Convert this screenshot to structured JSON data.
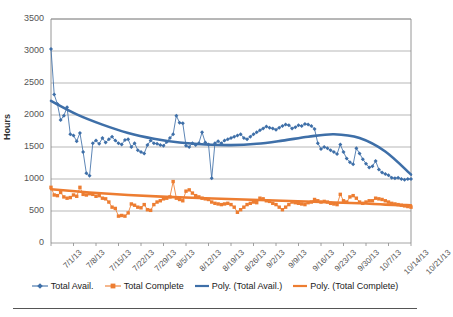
{
  "chart_data": {
    "type": "line",
    "title": "",
    "xlabel": "",
    "ylabel": "Hours",
    "ylim": [
      0,
      3500
    ],
    "ytick_values": [
      0,
      500,
      1000,
      1500,
      2000,
      2500,
      3000,
      3500
    ],
    "ytick_labels": [
      "0",
      "500",
      "1000",
      "1500",
      "2000",
      "2500",
      "3000",
      "3500"
    ],
    "grid": true,
    "legend_position": "bottom",
    "x_tick_labels": [
      "7/1/13",
      "7/8/13",
      "7/15/13",
      "7/22/13",
      "7/29/13",
      "8/5/13",
      "8/12/13",
      "8/19/13",
      "8/26/13",
      "9/2/13",
      "9/9/13",
      "9/16/13",
      "9/23/13",
      "9/30/13",
      "10/7/13",
      "10/14/13",
      "10/21/13"
    ],
    "x_tick_indices": [
      0,
      7,
      14,
      21,
      28,
      35,
      42,
      49,
      56,
      63,
      70,
      77,
      84,
      91,
      98,
      105,
      112
    ],
    "x_count": 113,
    "series": [
      {
        "name": "Total Avail.",
        "color": "#3E6FA8",
        "marker": "diamond",
        "values": [
          3030,
          2320,
          2170,
          1920,
          1990,
          2120,
          1700,
          1680,
          1590,
          1720,
          1420,
          1090,
          1050,
          1560,
          1600,
          1550,
          1640,
          1570,
          1620,
          1660,
          1600,
          1560,
          1540,
          1610,
          1620,
          1500,
          1560,
          1450,
          1420,
          1400,
          1530,
          1600,
          1560,
          1550,
          1530,
          1520,
          1580,
          1640,
          1700,
          1990,
          1880,
          1870,
          1520,
          1500,
          1560,
          1530,
          1560,
          1730,
          1570,
          1540,
          1010,
          1560,
          1590,
          1560,
          1600,
          1620,
          1640,
          1660,
          1680,
          1700,
          1640,
          1620,
          1660,
          1700,
          1730,
          1760,
          1790,
          1820,
          1800,
          1790,
          1770,
          1800,
          1830,
          1850,
          1840,
          1790,
          1810,
          1840,
          1830,
          1860,
          1850,
          1830,
          1780,
          1560,
          1470,
          1500,
          1480,
          1450,
          1420,
          1390,
          1540,
          1420,
          1320,
          1260,
          1230,
          1480,
          1400,
          1310,
          1240,
          1180,
          1200,
          1280,
          1150,
          1100,
          1080,
          1060,
          1020,
          1010,
          1020,
          1000,
          990,
          1000,
          1000
        ]
      },
      {
        "name": "Total Complete",
        "color": "#ED7D31",
        "marker": "square",
        "values": [
          870,
          750,
          740,
          790,
          720,
          700,
          710,
          750,
          730,
          870,
          760,
          750,
          770,
          760,
          730,
          740,
          700,
          690,
          640,
          560,
          540,
          420,
          430,
          420,
          470,
          610,
          590,
          560,
          550,
          600,
          520,
          510,
          600,
          640,
          660,
          690,
          700,
          720,
          960,
          700,
          680,
          660,
          810,
          830,
          780,
          740,
          720,
          700,
          690,
          680,
          640,
          620,
          610,
          600,
          610,
          620,
          600,
          560,
          480,
          520,
          560,
          600,
          620,
          640,
          630,
          700,
          690,
          660,
          650,
          620,
          600,
          560,
          520,
          560,
          600,
          640,
          630,
          620,
          610,
          600,
          630,
          640,
          680,
          660,
          640,
          650,
          640,
          620,
          610,
          600,
          760,
          660,
          640,
          720,
          740,
          700,
          640,
          620,
          640,
          660,
          660,
          700,
          690,
          680,
          660,
          640,
          620,
          610,
          600,
          590,
          580,
          570,
          560
        ]
      }
    ],
    "trendlines": [
      {
        "name": "Poly. (Total Avail.)",
        "color": "#3E6FA8",
        "points": [
          [
            0,
            2220
          ],
          [
            8,
            2010
          ],
          [
            16,
            1850
          ],
          [
            24,
            1720
          ],
          [
            32,
            1630
          ],
          [
            40,
            1570
          ],
          [
            48,
            1540
          ],
          [
            56,
            1530
          ],
          [
            64,
            1550
          ],
          [
            72,
            1600
          ],
          [
            80,
            1660
          ],
          [
            88,
            1700
          ],
          [
            96,
            1640
          ],
          [
            104,
            1430
          ],
          [
            112,
            1070
          ]
        ]
      },
      {
        "name": "Poly. (Total Complete)",
        "color": "#ED7D31",
        "points": [
          [
            0,
            840
          ],
          [
            12,
            790
          ],
          [
            24,
            750
          ],
          [
            36,
            720
          ],
          [
            48,
            700
          ],
          [
            60,
            680
          ],
          [
            72,
            660
          ],
          [
            84,
            640
          ],
          [
            96,
            620
          ],
          [
            104,
            600
          ],
          [
            112,
            590
          ]
        ]
      }
    ]
  },
  "legend": {
    "items": [
      {
        "label": "Total Avail.",
        "color": "#3E6FA8",
        "style": "line-marker",
        "marker": "diamond"
      },
      {
        "label": "Total Complete",
        "color": "#ED7D31",
        "style": "line-marker",
        "marker": "square"
      },
      {
        "label": "Poly. (Total Avail.)",
        "color": "#3E6FA8",
        "style": "line"
      },
      {
        "label": "Poly. (Total Complete)",
        "color": "#ED7D31",
        "style": "line"
      }
    ]
  }
}
